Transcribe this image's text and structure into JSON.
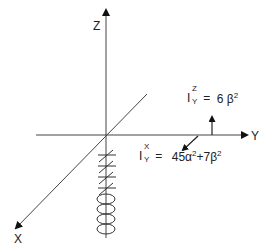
{
  "diagram": {
    "axes": {
      "z_label": "Z",
      "y_label": "Y",
      "x_label": "X"
    },
    "annotations": {
      "iz": {
        "base": "I",
        "superscript": "Z",
        "subscript": "Y",
        "equals": "=",
        "value": "6 β",
        "exp": "2"
      },
      "ix": {
        "base": "I",
        "superscript": "X",
        "subscript": "Y",
        "equals": "=",
        "term1": "45α",
        "exp1": "2",
        "plus": "+7β",
        "exp2": "2"
      }
    },
    "colors": {
      "line": "#3a3a3a",
      "background": "#ffffff"
    }
  }
}
